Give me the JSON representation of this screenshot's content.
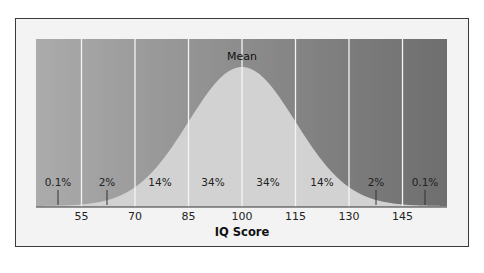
{
  "chart_data": {
    "type": "area",
    "title": "",
    "xlabel": "IQ Score",
    "ylabel": "",
    "x_ticks": [
      55,
      70,
      85,
      100,
      115,
      130,
      145
    ],
    "x_tick_labels": [
      "55",
      "70",
      "85",
      "100",
      "115",
      "130",
      "145"
    ],
    "distribution": {
      "kind": "normal",
      "mean": 100,
      "sd": 15
    },
    "annotation": {
      "label": "Mean",
      "x": 100
    },
    "segments": [
      {
        "range": "< 55",
        "percent": "0.1%"
      },
      {
        "range": "55-70",
        "percent": "2%"
      },
      {
        "range": "70-85",
        "percent": "14%"
      },
      {
        "range": "85-100",
        "percent": "34%"
      },
      {
        "range": "100-115",
        "percent": "34%"
      },
      {
        "range": "115-130",
        "percent": "14%"
      },
      {
        "range": "130-145",
        "percent": "2%"
      },
      {
        "range": "> 145",
        "percent": "0.1%"
      }
    ],
    "grid": {
      "vertical": true,
      "horizontal": false
    },
    "legend": null,
    "colors": {
      "background_left": "#ababab",
      "background_right": "#6e6e6e",
      "curve_fill": "#d2d2d2",
      "grid_line": "#f4f4f4",
      "frame": "#f3f3f3"
    }
  }
}
